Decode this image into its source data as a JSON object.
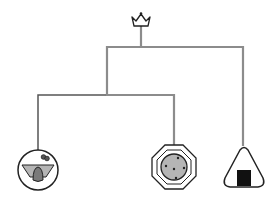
{
  "diagram": {
    "type": "tree",
    "root": {
      "icon": "crown-icon",
      "x": 140,
      "y": 18
    },
    "edge_colors": {
      "gray": "#8c8c8c",
      "dark": "#555555"
    },
    "leaves": [
      {
        "id": "leaf-1",
        "icon": "bowl-face-icon",
        "x": 38,
        "y": 170
      },
      {
        "id": "leaf-2",
        "icon": "octagon-cookie-icon",
        "x": 174,
        "y": 167
      },
      {
        "id": "leaf-3",
        "icon": "onigiri-icon",
        "x": 244,
        "y": 168
      }
    ],
    "colors": {
      "fill_gray": "#b5b5b5",
      "dark_gray": "#7a7a7a",
      "black": "#111111",
      "outline": "#222222"
    }
  }
}
